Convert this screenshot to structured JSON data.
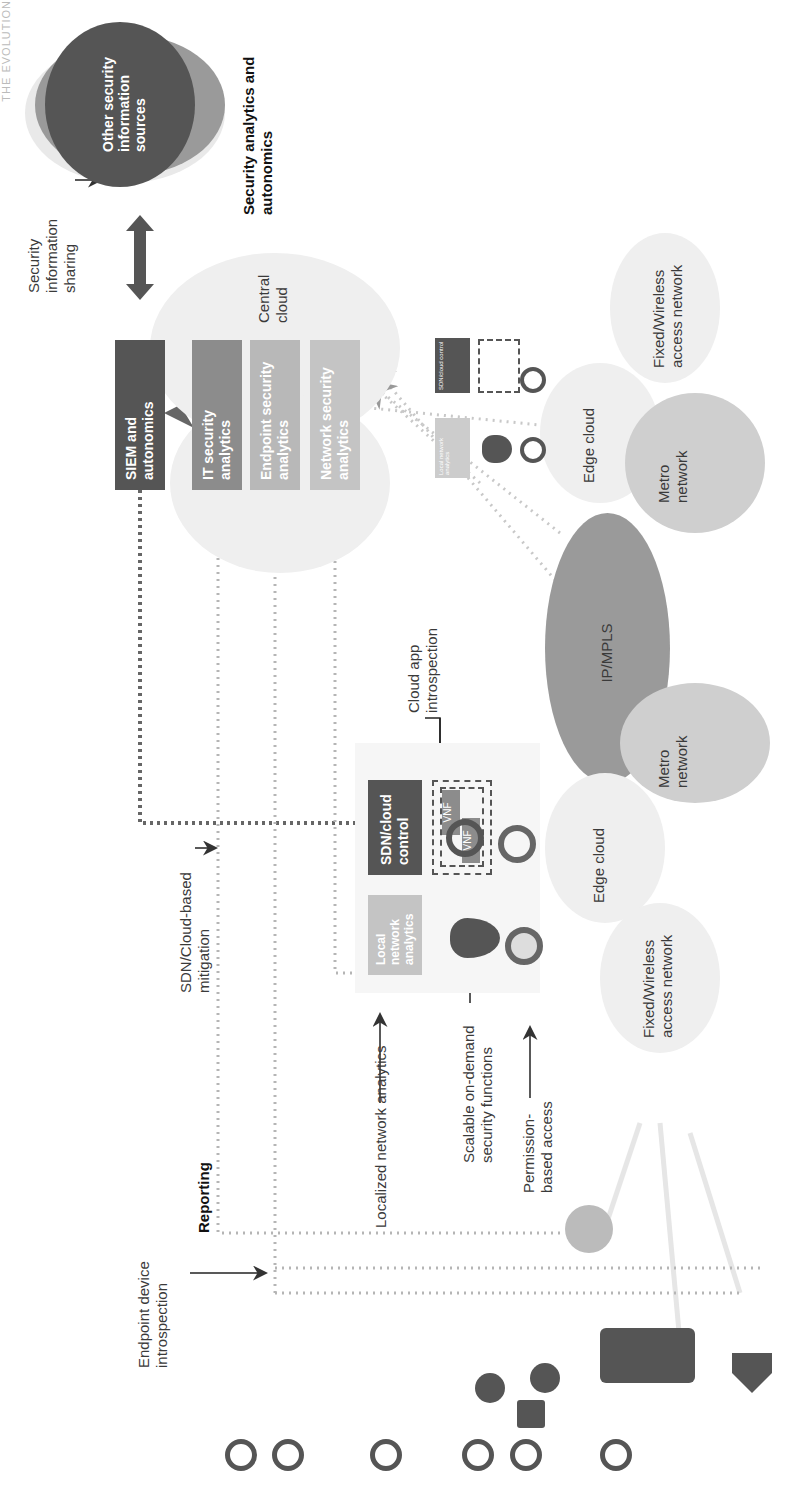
{
  "header": {
    "running_title": "THE EVOLUTION"
  },
  "sections": {
    "security_analytics_title": "Security analytics and autonomics",
    "reporting_title": "Reporting"
  },
  "external": {
    "other_sources": "Other security information sources",
    "sharing_label": "Security information sharing"
  },
  "central_cloud": {
    "label": "Central cloud",
    "boxes": [
      {
        "id": "siem",
        "label": "SIEM and autonomics",
        "color": "#555555"
      },
      {
        "id": "it",
        "label": "IT security analytics",
        "color": "#8c8c8c"
      },
      {
        "id": "endpoint",
        "label": "Endpoint security analytics",
        "color": "#b8b8b8"
      },
      {
        "id": "network",
        "label": "Network security analytics",
        "color": "#c4c4c4"
      }
    ]
  },
  "network": {
    "ip_mpls": "IP/MPLS",
    "metro_top": "Metro network",
    "metro_bottom": "Metro network",
    "edge_cloud_top": "Edge cloud",
    "edge_cloud_bottom": "Edge cloud",
    "access_top": "Fixed/Wireless access network",
    "access_bottom": "Fixed/Wireless access network"
  },
  "edge_detail": {
    "sdn_control": "SDN/cloud control",
    "local_analytics": "Local network analytics",
    "vnf1": "VNF",
    "vnf2": "VNF",
    "mini_sdn": "SDN/cloud control",
    "mini_local": "Local network analytics"
  },
  "annotations": {
    "cloud_app_introspection": "Cloud app introspection",
    "sdn_mitigation": "SDN/Cloud-based mitigation",
    "localized_analytics": "Localized network analytics",
    "scalable_functions": "Scalable on-demand security functions",
    "permission_access": "Permission-based access",
    "endpoint_introspection": "Endpoint device introspection"
  },
  "colors": {
    "dark": "#555555",
    "mid": "#8c8c8c",
    "light": "#c4c4c4",
    "cloud": "#efefef",
    "ipmpls": "#9a9a9a",
    "metro": "#cfcfcf",
    "dotted": "#b5b5b5"
  }
}
